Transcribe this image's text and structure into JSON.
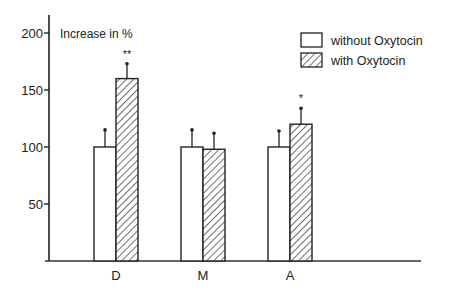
{
  "chart_data": {
    "type": "bar",
    "title": "",
    "xlabel": "",
    "ylabel": "Increase in %",
    "ylim": [
      0,
      220
    ],
    "yticks": [
      50,
      100,
      150,
      200
    ],
    "categories": [
      "D",
      "M",
      "A"
    ],
    "series": [
      {
        "name": "without Oxytocin",
        "pattern": "none",
        "values": [
          100,
          100,
          100
        ],
        "errors": [
          15,
          15,
          14
        ]
      },
      {
        "name": "with Oxytocin",
        "pattern": "hatched",
        "values": [
          160,
          98,
          120
        ],
        "errors": [
          13,
          14,
          14
        ]
      }
    ],
    "significance": [
      "**",
      "",
      "*"
    ],
    "legend": {
      "placement": "top-right",
      "entries": [
        "without Oxytocin",
        "with Oxytocin"
      ]
    },
    "grid": false
  }
}
